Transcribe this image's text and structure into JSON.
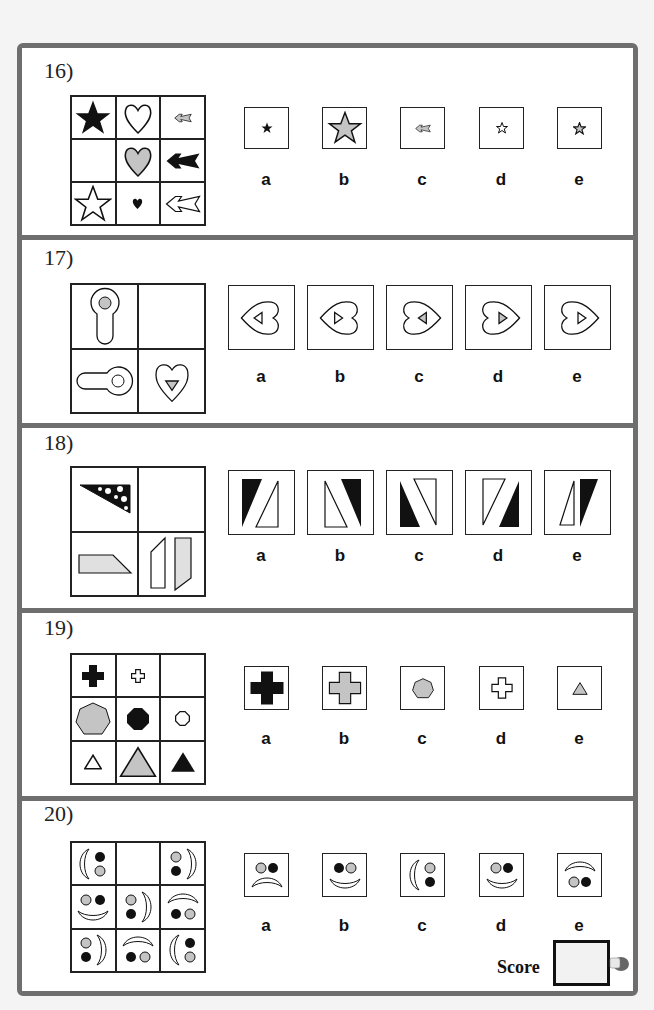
{
  "questions": [
    {
      "number": "16)",
      "options": [
        "a",
        "b",
        "c",
        "d",
        "e"
      ],
      "matrix": [
        "black-star",
        "white-heart",
        "small-gray-arrow",
        "empty",
        "gray-heart",
        "black-arrow",
        "white-star",
        "small-black-heart",
        "white-arrow"
      ],
      "option_shapes": [
        "small-black-star",
        "large-gray-star",
        "small-gray-arrow",
        "small-white-star",
        "small-gray-star"
      ]
    },
    {
      "number": "17)",
      "options": [
        "a",
        "b",
        "c",
        "d",
        "e"
      ],
      "matrix": [
        "keyhole-up-gray-dot",
        "empty",
        "keyhole-left-white-dot",
        "heart-down-gray-triangle"
      ],
      "option_shapes": [
        "heart-left-white-triangle-left",
        "heart-left-white-triangle-right",
        "heart-right-gray-triangle-left",
        "heart-right-gray-triangle-right",
        "heart-right-white-triangle-right"
      ]
    },
    {
      "number": "18)",
      "options": [
        "a",
        "b",
        "c",
        "d",
        "e"
      ],
      "matrix": [
        "spotted-triangle",
        "empty",
        "textured-trapezoid",
        "split-parallelograms"
      ],
      "option_shapes": [
        "spotted-left-white-right",
        "white-left-spotted-right",
        "spotted-left-white-right-flipped",
        "white-left-spotted-right-flipped",
        "white-left-spotted-right-small"
      ]
    },
    {
      "number": "19)",
      "options": [
        "a",
        "b",
        "c",
        "d",
        "e"
      ],
      "matrix": [
        "black-cross",
        "small-white-cross",
        "empty",
        "gray-heptagon",
        "black-octagon",
        "small-white-octagon",
        "small-white-triangle",
        "gray-triangle",
        "black-triangle"
      ],
      "option_shapes": [
        "large-black-cross",
        "gray-cross",
        "gray-heptagon",
        "white-cross",
        "small-gray-triangle"
      ]
    },
    {
      "number": "20)",
      "options": [
        "a",
        "b",
        "c",
        "d",
        "e"
      ],
      "matrix": [
        "face-left",
        "empty",
        "face-right",
        "face-smile",
        "face-right",
        "face-frown",
        "face-right",
        "face-frown",
        "face-left"
      ],
      "option_shapes": [
        "face-sad",
        "face-smile-black-gray",
        "face-left",
        "face-smile-gray-black",
        "face-frown"
      ]
    }
  ],
  "score": {
    "label": "Score",
    "value": ""
  },
  "colors": {
    "border": "#6e6e6e",
    "gray_fill": "#c4c4c4",
    "black": "#111111"
  }
}
